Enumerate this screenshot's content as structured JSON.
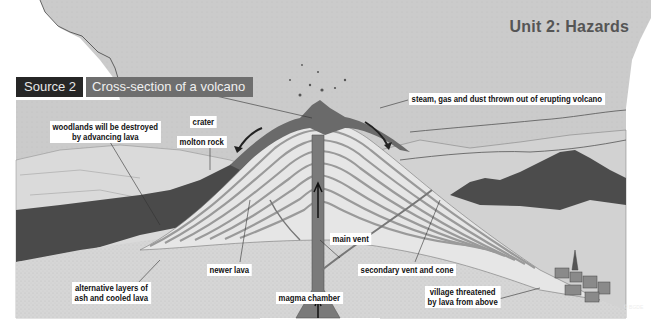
{
  "header": {
    "unit_title": "Unit 2: Hazards",
    "source_label": "Source 2",
    "source_title": "Cross-section of a volcano"
  },
  "diagram": {
    "labels": {
      "steam": "steam, gas and dust thrown out of erupting volcano",
      "woodlands_line1": "woodlands will be destroyed",
      "woodlands_line2": "by advancing lava",
      "crater": "crater",
      "molten_rock": "molton rock",
      "main_vent": "main vent",
      "newer_lava": "newer lava",
      "secondary_vent": "secondary vent and cone",
      "layers_line1": "alternative layers of",
      "layers_line2": "ash and cooled lava",
      "magma_chamber": "magma chamber",
      "village_line1": "village threatened",
      "village_line2": "by lava from above"
    },
    "credit": "© BGDE"
  },
  "colors": {
    "sky": "#c9c9c9",
    "ground": "#d4d4d4",
    "lava_dark": "#6a6a6a",
    "vent": "#7a7a7a",
    "layer_light": "#e6e6e6",
    "layer_dark": "#9a9a9a",
    "forest": "#4a4a4a",
    "source_tag_bg": "#262626",
    "source_title_bg": "#6e6e6e",
    "unit_title": "#555555"
  }
}
